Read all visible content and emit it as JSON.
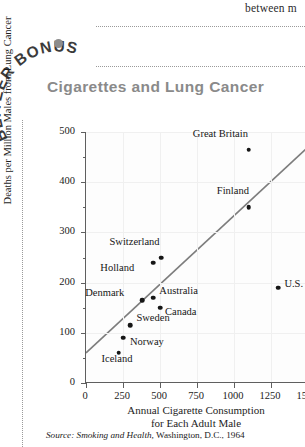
{
  "page": {
    "top_fragment": "between m",
    "badge_text": "BLITZER BONUS",
    "source_prefix": "Source:",
    "source_italic": "Smoking and Health,",
    "source_rest": "Washington, D.C., 1964",
    "accent_color": "#8a8a8a",
    "trend_color": "#7d7d7d",
    "point_color": "#161616"
  },
  "chart_data": {
    "type": "scatter",
    "title": "Cigarettes and Lung Cancer",
    "xlabel_line1": "Annual Cigarette Consumption",
    "xlabel_line2": "for Each Adult Male",
    "ylabel": "Deaths per Million Males from Lung Cancer",
    "xlim": [
      0,
      1500
    ],
    "ylim": [
      0,
      500
    ],
    "xticks": [
      0,
      250,
      500,
      750,
      1000,
      1250,
      1500
    ],
    "yticks": [
      0,
      100,
      200,
      300,
      400,
      500
    ],
    "yticks_minor": [
      50,
      150,
      250,
      350,
      450
    ],
    "grid": true,
    "legend": "none",
    "trendline": {
      "type": "regression-line",
      "x0": 0,
      "y0": 60,
      "x1": 1500,
      "y1": 470
    },
    "points": [
      {
        "label": "Great Britain",
        "x": 1100,
        "y": 465,
        "label_dx": -56,
        "label_dy": -15
      },
      {
        "label": "Finland",
        "x": 1100,
        "y": 350,
        "label_dx": -32,
        "label_dy": -15
      },
      {
        "label": "Switzerland",
        "x": 510,
        "y": 250,
        "label_dx": -52,
        "label_dy": -15
      },
      {
        "label": "Holland",
        "x": 455,
        "y": 240,
        "label_dx": -53,
        "label_dy": 6
      },
      {
        "label": "Denmark",
        "x": 380,
        "y": 165,
        "label_dx": -57,
        "label_dy": -6
      },
      {
        "label": "Australia",
        "x": 455,
        "y": 170,
        "label_dx": 6,
        "label_dy": -6
      },
      {
        "label": "Canada",
        "x": 500,
        "y": 150,
        "label_dx": 5,
        "label_dy": 5
      },
      {
        "label": "Sweden",
        "x": 300,
        "y": 115,
        "label_dx": 6,
        "label_dy": -6
      },
      {
        "label": "Norway",
        "x": 250,
        "y": 90,
        "label_dx": 7,
        "label_dy": 5
      },
      {
        "label": "Iceland",
        "x": 220,
        "y": 60,
        "label_dx": -17,
        "label_dy": 7
      },
      {
        "label": "U.S.",
        "x": 1300,
        "y": 190,
        "label_dx": 6,
        "label_dy": -3
      }
    ]
  }
}
